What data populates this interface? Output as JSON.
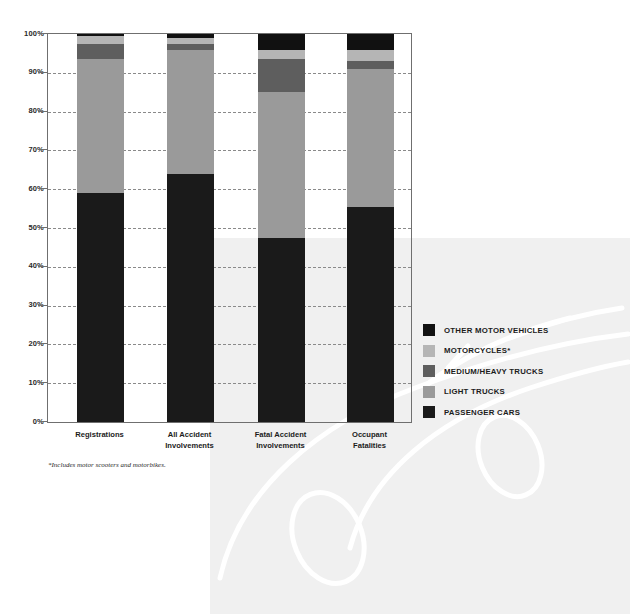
{
  "chart_data": {
    "type": "bar",
    "title": "",
    "subtitle": "",
    "xlabel": "",
    "ylabel": "",
    "ylim": [
      0,
      100
    ],
    "stacked": true,
    "stack_total": 100,
    "grid": true,
    "legend_position": "right",
    "categories": [
      "Registrations",
      "All Accident Involvements",
      "Fatal Accident Involvements",
      "Occupant Fatalities"
    ],
    "category_lines": [
      [
        "Registrations"
      ],
      [
        "All Accident",
        "Involvements"
      ],
      [
        "Fatal Accident",
        "Involvements"
      ],
      [
        "Occupant",
        "Fatalities"
      ]
    ],
    "ytick_labels": [
      "0%",
      "10%",
      "20%",
      "30%",
      "40%",
      "50%",
      "60%",
      "70%",
      "80%",
      "90%",
      "100%"
    ],
    "ytick_values": [
      0,
      10,
      20,
      30,
      40,
      50,
      60,
      70,
      80,
      90,
      100
    ],
    "series": [
      {
        "name": "PASSENGER CARS",
        "color": "#1a1a1a",
        "values": [
          59.0,
          64.0,
          47.5,
          55.5
        ]
      },
      {
        "name": "LIGHT TRUCKS",
        "color": "#9a9a9a",
        "values": [
          34.5,
          32.0,
          37.5,
          35.5
        ]
      },
      {
        "name": "MEDIUM/HEAVY TRUCKS",
        "color": "#5e5e5e",
        "values": [
          4.0,
          1.5,
          8.5,
          2.0
        ]
      },
      {
        "name": "MOTORCYCLES*",
        "color": "#b5b5b5",
        "values": [
          2.0,
          1.5,
          2.5,
          3.0
        ]
      },
      {
        "name": "OTHER MOTOR VEHICLES",
        "color": "#111111",
        "values": [
          0.5,
          1.0,
          4.0,
          4.0
        ]
      }
    ],
    "legend_entries": [
      {
        "label": "OTHER MOTOR VEHICLES",
        "color": "#111111"
      },
      {
        "label": "MOTORCYCLES*",
        "color": "#b5b5b5"
      },
      {
        "label": "MEDIUM/HEAVY TRUCKS",
        "color": "#5e5e5e"
      },
      {
        "label": "LIGHT TRUCKS",
        "color": "#9a9a9a"
      },
      {
        "label": "PASSENGER CARS",
        "color": "#1a1a1a"
      }
    ],
    "footnote": "*Includes motor scooters and motorbikes.",
    "colors": {
      "background": "#ffffff",
      "watermark_panel": "#f0f0f0",
      "axis": "#6f6f6f",
      "gridline": "#8a8a8a",
      "text": "#1c1c1c"
    }
  }
}
